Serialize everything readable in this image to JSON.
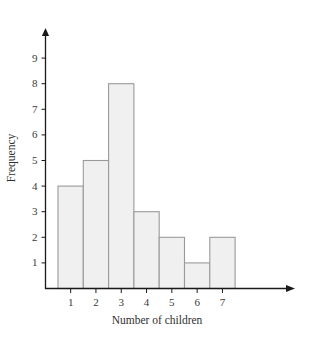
{
  "chart_data": {
    "type": "bar",
    "title": "",
    "subtitle": "",
    "xlabel": "Number of children",
    "ylabel": "Frequency",
    "categories": [
      "1",
      "2",
      "3",
      "4",
      "5",
      "6",
      "7"
    ],
    "values": [
      4,
      5,
      8,
      3,
      2,
      1,
      2
    ],
    "series": [
      {
        "name": "Frequency",
        "values": [
          4,
          5,
          8,
          3,
          2,
          1,
          2
        ]
      }
    ],
    "xlim": [
      0.5,
      7.5
    ],
    "ylim": [
      0,
      9
    ],
    "ytick_labels": [
      "1",
      "2",
      "3",
      "4",
      "5",
      "6",
      "7",
      "8",
      "9"
    ],
    "ytick_values": [
      1,
      2,
      3,
      4,
      5,
      6,
      7,
      8,
      9
    ],
    "xtick_labels": [
      "1",
      "2",
      "3",
      "4",
      "5",
      "6",
      "7"
    ],
    "grid": false,
    "legend": false,
    "legend_position": "none",
    "bar_fill_color": "#f0f0f0",
    "bar_border_color": "#9a9a9a",
    "axis_color": "#1a1a1a",
    "text_color": "#2f2f2f",
    "background_color": "#ffffff",
    "annotations": []
  }
}
